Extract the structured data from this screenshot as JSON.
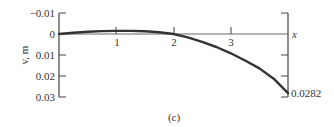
{
  "chart_data": {
    "type": "line",
    "title": "",
    "caption": "(c)",
    "xlabel": "x",
    "ylabel": "v, m",
    "x_ticks": [
      "1",
      "2",
      "3"
    ],
    "y_ticks": [
      "−0.01",
      "0",
      "0.01",
      "0.02",
      "0.03"
    ],
    "y_inverted": true,
    "xlim": [
      0,
      4
    ],
    "ylim": [
      -0.01,
      0.03
    ],
    "end_annotation": "0.0282",
    "series": [
      {
        "name": "deflection v",
        "x": [
          0,
          0.25,
          0.5,
          0.75,
          1.0,
          1.25,
          1.5,
          1.75,
          2.0,
          2.25,
          2.5,
          2.75,
          3.0,
          3.25,
          3.5,
          3.75,
          4.0
        ],
        "y": [
          0,
          -0.0006,
          -0.0011,
          -0.0014,
          -0.0015,
          -0.0015,
          -0.0013,
          -0.0008,
          0,
          0.0016,
          0.0037,
          0.0062,
          0.0092,
          0.0126,
          0.0164,
          0.0213,
          0.0282
        ]
      }
    ],
    "grid": false
  }
}
